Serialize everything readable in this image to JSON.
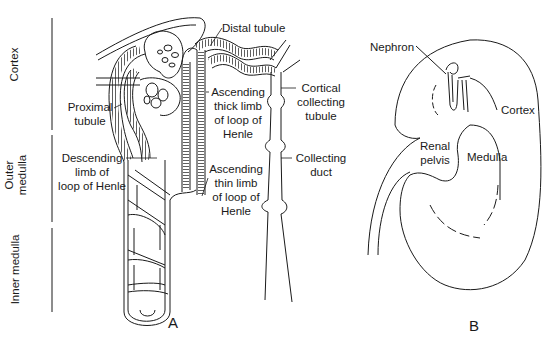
{
  "panel_a": {
    "letter": "A",
    "zones": {
      "cortex": "Cortex",
      "outer_medulla_line1": "Outer",
      "outer_medulla_line2": "medulla",
      "inner_medulla": "Inner medulla"
    },
    "labels": {
      "distal_tubule": "Distal tubule",
      "proximal_tubule_1": "Proximal",
      "proximal_tubule_2": "tubule",
      "descending_1": "Descending",
      "descending_2": "limb of",
      "descending_3": "loop of Henle",
      "asc_thick_1": "Ascending",
      "asc_thick_2": "thick limb",
      "asc_thick_3": "of loop of",
      "asc_thick_4": "Henle",
      "asc_thin_1": "Ascending",
      "asc_thin_2": "thin limb",
      "asc_thin_3": "of loop of",
      "asc_thin_4": "Henle",
      "cortical_1": "Cortical",
      "cortical_2": "collecting",
      "cortical_3": "tubule",
      "collecting_1": "Collecting",
      "collecting_2": "duct"
    }
  },
  "panel_b": {
    "letter": "B",
    "labels": {
      "nephron": "Nephron",
      "cortex": "Cortex",
      "renal_1": "Renal",
      "renal_2": "pelvis",
      "medulla": "Medulla"
    }
  },
  "colors": {
    "ink": "#1a1a1a",
    "background": "#ffffff"
  }
}
